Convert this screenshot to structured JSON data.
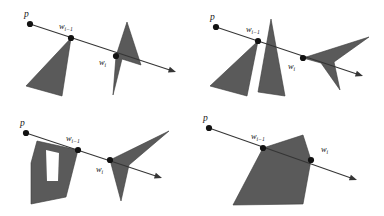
{
  "figure": {
    "background_color": "#ffffff",
    "polygon_fill": "#5a5a5a",
    "polygon_stroke": "#3a3a3a",
    "ray_color": "#353535",
    "vertex_color": "#121212",
    "label_color": "#161616",
    "panel_count": 4,
    "labels": {
      "p": "p",
      "w_base": "w",
      "w_prev_sub": "i−1",
      "w_cur_sub": "i"
    }
  },
  "panels": [
    {
      "id": "panel-top-left",
      "position": "top-left",
      "description": "Ray passes through vertex w_{i-1} of a triangle and through the notch vertex w_i of a dart-shaped polygon",
      "origin": {
        "label": "p",
        "x": 30,
        "y": 24
      },
      "w_prev": {
        "label": "w",
        "sub": "i−1",
        "x": 71,
        "y": 38
      },
      "w_cur": {
        "label": "w",
        "sub": "i",
        "x": 116,
        "y": 56
      },
      "ray_end": {
        "x": 176,
        "y": 72
      },
      "shapes": [
        {
          "name": "triangle-left",
          "kind": "triangle",
          "points": "71,38 26,86 62,96"
        },
        {
          "name": "dart-right",
          "kind": "concave-dart",
          "points": "127,22 116,56 113,95 122,59 141,65"
        }
      ]
    },
    {
      "id": "panel-top-right",
      "position": "top-right",
      "description": "Ray grazes vertex w_{i-1} of the left triangle, crosses a tall narrow spike, then meets vertex w_i of a right-pointing dart",
      "origin": {
        "label": "p",
        "x": 216,
        "y": 27
      },
      "w_prev": {
        "label": "w",
        "sub": "i−1",
        "x": 258,
        "y": 41
      },
      "w_cur": {
        "label": "w",
        "sub": "i",
        "x": 303,
        "y": 58
      },
      "ray_end": {
        "x": 363,
        "y": 76
      },
      "shapes": [
        {
          "name": "triangle-left",
          "kind": "triangle",
          "points": "258,41 210,86 247,96"
        },
        {
          "name": "spike-middle",
          "kind": "spike",
          "points": "271,19 285,96 258,92"
        },
        {
          "name": "dart-right",
          "kind": "concave-dart",
          "points": "303,58 369,37 334,62 340,90 321,63"
        }
      ]
    },
    {
      "id": "panel-bottom-left",
      "position": "bottom-left",
      "description": "Ray crosses a polygon with a rectangular white notch at vertex w_{i-1}, then meets vertex w_i of a right dart",
      "origin": {
        "label": "p",
        "x": 26,
        "y": 133
      },
      "w_prev": {
        "label": "w",
        "sub": "i−1",
        "x": 78,
        "y": 150
      },
      "w_cur": {
        "label": "w",
        "sub": "i",
        "x": 110,
        "y": 160
      },
      "ray_end": {
        "x": 162,
        "y": 178
      },
      "shapes": [
        {
          "name": "notched-polygon",
          "kind": "polygon-with-hole",
          "points": "37,141 78,150 66,197 31,204 31,163",
          "notch": "46,150 59,153 58,181 47,181"
        },
        {
          "name": "dart-right",
          "kind": "concave-dart",
          "points": "110,160 169,131 129,165 121,201"
        }
      ]
    },
    {
      "id": "panel-bottom-right",
      "position": "bottom-right",
      "description": "Ray enters a convex quadrilateral at vertex w_{i-1} and exits at vertex w_i",
      "origin": {
        "label": "p",
        "x": 209,
        "y": 128
      },
      "w_prev": {
        "label": "w",
        "sub": "i−1",
        "x": 263,
        "y": 148
      },
      "w_cur": {
        "label": "w",
        "sub": "i",
        "x": 311,
        "y": 160
      },
      "ray_end": {
        "x": 357,
        "y": 180
      },
      "shapes": [
        {
          "name": "quadrilateral",
          "kind": "convex-quad",
          "points": "263,148 303,135 311,160 303,204 233,205"
        }
      ]
    }
  ]
}
